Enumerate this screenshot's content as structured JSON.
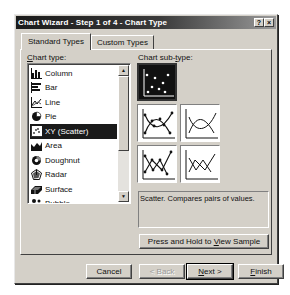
{
  "window": {
    "title": "Chart Wizard - Step 1 of 4 - Chart Type",
    "help_button": "?",
    "close_button": "×"
  },
  "tabs": [
    {
      "label": "Standard Types",
      "active": true
    },
    {
      "label": "Custom Types",
      "active": false
    }
  ],
  "chart_type": {
    "label": "Chart type:",
    "label_accesskey": "C",
    "items": [
      {
        "label": "Column",
        "icon": "column-chart-icon",
        "selected": false
      },
      {
        "label": "Bar",
        "icon": "bar-chart-icon",
        "selected": false
      },
      {
        "label": "Line",
        "icon": "line-chart-icon",
        "selected": false
      },
      {
        "label": "Pie",
        "icon": "pie-chart-icon",
        "selected": false
      },
      {
        "label": "XY (Scatter)",
        "icon": "scatter-chart-icon",
        "selected": true
      },
      {
        "label": "Area",
        "icon": "area-chart-icon",
        "selected": false
      },
      {
        "label": "Doughnut",
        "icon": "doughnut-chart-icon",
        "selected": false
      },
      {
        "label": "Radar",
        "icon": "radar-chart-icon",
        "selected": false
      },
      {
        "label": "Surface",
        "icon": "surface-chart-icon",
        "selected": false
      },
      {
        "label": "Bubble",
        "icon": "bubble-chart-icon",
        "selected": false
      }
    ]
  },
  "chart_subtype": {
    "label": "Chart sub-type:",
    "label_accesskey": "t",
    "items": [
      {
        "name": "scatter-markers-only",
        "selected": true
      },
      {
        "name": "scatter-smoothed-lines-markers",
        "selected": false
      },
      {
        "name": "scatter-smoothed-lines",
        "selected": false
      },
      {
        "name": "scatter-straight-lines-markers",
        "selected": false
      },
      {
        "name": "scatter-straight-lines",
        "selected": false
      }
    ],
    "description": "Scatter. Compares pairs of values."
  },
  "sample_button": {
    "label_pre": "Press and Hold to ",
    "label_key": "V",
    "label_post": "iew Sample"
  },
  "footer": {
    "cancel": "Cancel",
    "back": "< Back",
    "back_key": "B",
    "next_key": "N",
    "next_post": "ext >",
    "finish_key": "F",
    "finish_post": "inish"
  }
}
